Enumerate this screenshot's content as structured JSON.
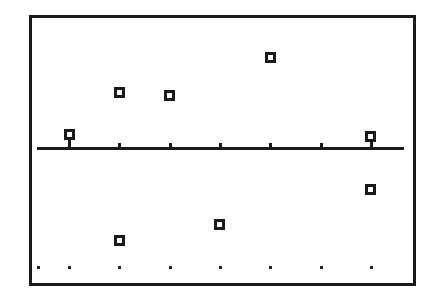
{
  "chart_data": {
    "type": "scatter",
    "title": "",
    "xlabel": "",
    "ylabel": "",
    "xlim": [
      0.38,
      7.8
    ],
    "ylim": [
      -11,
      11
    ],
    "grid": false,
    "legend": null,
    "x_ticks": [
      1,
      2,
      3,
      4,
      5,
      6,
      7
    ],
    "bottom_dot_row_y": -10,
    "bottom_dot_row_x": [
      0.38,
      1,
      2,
      3,
      4,
      5,
      6,
      7
    ],
    "series": [
      {
        "name": "points",
        "marker": "hollow-square",
        "color": "#1a1a1a",
        "points": [
          {
            "x": 1,
            "y": 1.1
          },
          {
            "x": 2,
            "y": 4.7
          },
          {
            "x": 3,
            "y": 4.4
          },
          {
            "x": 5,
            "y": 7.6
          },
          {
            "x": 7,
            "y": 1.0
          },
          {
            "x": 2,
            "y": -7.8
          },
          {
            "x": 4,
            "y": -6.4
          },
          {
            "x": 7,
            "y": -3.5
          }
        ]
      }
    ]
  },
  "colors": {
    "ink": "#1a1a1a",
    "background": "#ffffff"
  }
}
